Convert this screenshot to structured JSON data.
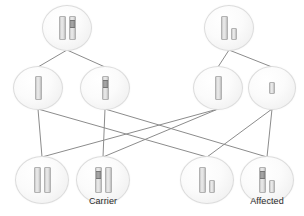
{
  "diagram": {
    "canvas": {
      "width": 304,
      "height": 216
    },
    "colors": {
      "background": "#ffffff",
      "bubble_border": "#dcdcdc",
      "bubble_fill": "#f4f4f4",
      "chromosome_fill": "#e2e2e2",
      "chromosome_border": "#b2b2b2",
      "mutation_band": "#8a8a8a",
      "edge_line": "#8c8c8c",
      "caption_text": "#2b2b2b"
    },
    "rows": [
      {
        "name": "parents",
        "y": 28,
        "nodes": [
          {
            "id": "parent-mother",
            "label": "",
            "x": 67,
            "bubble_w": 48,
            "bubble_h": 44,
            "chromosomes": [
              {
                "kind": "X",
                "w": 7,
                "h": 24,
                "band": false
              },
              {
                "kind": "X",
                "w": 7,
                "h": 24,
                "band": true,
                "band_top": 3,
                "band_h": 6
              }
            ]
          },
          {
            "id": "parent-father",
            "label": "",
            "x": 229,
            "bubble_w": 48,
            "bubble_h": 44,
            "chromosomes": [
              {
                "kind": "X",
                "w": 7,
                "h": 24,
                "band": false
              },
              {
                "kind": "Y",
                "w": 6,
                "h": 12,
                "band": false
              }
            ]
          }
        ]
      },
      {
        "name": "gametes",
        "y": 88,
        "nodes": [
          {
            "id": "gamete-mother-x-normal",
            "label": "",
            "x": 38,
            "bubble_w": 48,
            "bubble_h": 42,
            "chromosomes": [
              {
                "kind": "X",
                "w": 7,
                "h": 24,
                "band": false
              }
            ]
          },
          {
            "id": "gamete-mother-x-mutant",
            "label": "",
            "x": 105,
            "bubble_w": 48,
            "bubble_h": 42,
            "chromosomes": [
              {
                "kind": "X",
                "w": 7,
                "h": 24,
                "band": true,
                "band_top": 3,
                "band_h": 6
              }
            ]
          },
          {
            "id": "gamete-father-x",
            "label": "",
            "x": 218,
            "bubble_w": 48,
            "bubble_h": 42,
            "chromosomes": [
              {
                "kind": "X",
                "w": 7,
                "h": 24,
                "band": false
              }
            ]
          },
          {
            "id": "gamete-father-y",
            "label": "",
            "x": 272,
            "bubble_w": 46,
            "bubble_h": 42,
            "chromosomes": [
              {
                "kind": "Y",
                "w": 6,
                "h": 12,
                "band": false
              }
            ]
          }
        ]
      },
      {
        "name": "offspring",
        "y": 180,
        "nodes": [
          {
            "id": "offspring-unaffected-female",
            "label": "",
            "x": 42,
            "bubble_w": 52,
            "bubble_h": 46,
            "chromosomes": [
              {
                "kind": "X",
                "w": 7,
                "h": 26,
                "band": false
              },
              {
                "kind": "X",
                "w": 7,
                "h": 26,
                "band": false
              }
            ]
          },
          {
            "id": "offspring-carrier-female",
            "label": "Carrier",
            "x": 103,
            "bubble_w": 52,
            "bubble_h": 46,
            "chromosomes": [
              {
                "kind": "X",
                "w": 7,
                "h": 26,
                "band": true,
                "band_top": 3,
                "band_h": 6
              },
              {
                "kind": "X",
                "w": 7,
                "h": 26,
                "band": false
              }
            ]
          },
          {
            "id": "offspring-unaffected-male",
            "label": "",
            "x": 207,
            "bubble_w": 52,
            "bubble_h": 46,
            "chromosomes": [
              {
                "kind": "X",
                "w": 7,
                "h": 26,
                "band": false
              },
              {
                "kind": "Y",
                "w": 6,
                "h": 13,
                "band": false
              }
            ]
          },
          {
            "id": "offspring-affected-male",
            "label": "Affected",
            "x": 267,
            "bubble_w": 52,
            "bubble_h": 46,
            "chromosomes": [
              {
                "kind": "X",
                "w": 7,
                "h": 26,
                "band": true,
                "band_top": 3,
                "band_h": 6
              },
              {
                "kind": "Y",
                "w": 6,
                "h": 13,
                "band": false
              }
            ]
          }
        ]
      }
    ],
    "captions": [
      {
        "id": "caption-carrier",
        "text": "Carrier",
        "x": 103,
        "y": 196
      },
      {
        "id": "caption-affected",
        "text": "Affected",
        "x": 267,
        "y": 196
      }
    ],
    "edges": [
      {
        "id": "edge-mother-to-x-normal",
        "x1": 67,
        "y1": 50,
        "x2": 38,
        "y2": 67
      },
      {
        "id": "edge-mother-to-x-mutant",
        "x1": 67,
        "y1": 50,
        "x2": 105,
        "y2": 67
      },
      {
        "id": "edge-father-to-x",
        "x1": 229,
        "y1": 50,
        "x2": 218,
        "y2": 67
      },
      {
        "id": "edge-father-to-y",
        "x1": 229,
        "y1": 50,
        "x2": 272,
        "y2": 67
      },
      {
        "id": "edge-xnormal-to-female",
        "x1": 38,
        "y1": 109,
        "x2": 42,
        "y2": 157
      },
      {
        "id": "edge-xnormal-to-male",
        "x1": 38,
        "y1": 109,
        "x2": 207,
        "y2": 157
      },
      {
        "id": "edge-xmutant-to-carrier",
        "x1": 105,
        "y1": 109,
        "x2": 103,
        "y2": 157
      },
      {
        "id": "edge-xmutant-to-affected",
        "x1": 105,
        "y1": 109,
        "x2": 267,
        "y2": 157
      },
      {
        "id": "edge-fatherx-to-female",
        "x1": 218,
        "y1": 109,
        "x2": 42,
        "y2": 157
      },
      {
        "id": "edge-fatherx-to-carrier",
        "x1": 218,
        "y1": 109,
        "x2": 103,
        "y2": 157
      },
      {
        "id": "edge-fathery-to-male",
        "x1": 272,
        "y1": 109,
        "x2": 207,
        "y2": 157
      },
      {
        "id": "edge-fathery-to-affected",
        "x1": 272,
        "y1": 109,
        "x2": 267,
        "y2": 157
      }
    ]
  }
}
